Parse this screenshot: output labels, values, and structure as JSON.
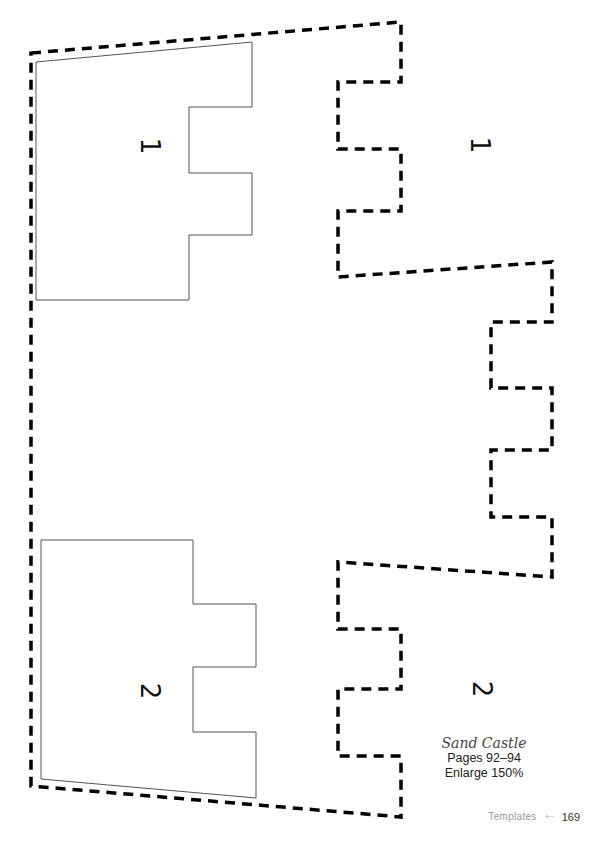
{
  "template": {
    "pieces": [
      {
        "label": "1",
        "position": "left"
      },
      {
        "label": "1",
        "position": "right"
      },
      {
        "label": "2",
        "position": "left"
      },
      {
        "label": "2",
        "position": "right"
      }
    ]
  },
  "caption": {
    "title": "Sand Castle",
    "pages": "Pages 92–94",
    "enlarge": "Enlarge 150%"
  },
  "footer": {
    "section": "Templates",
    "arrow": "⇠",
    "page_number": "169"
  },
  "colors": {
    "outline": "#000000",
    "solid_line": "#555555",
    "footer_text": "#9a9a9a"
  }
}
